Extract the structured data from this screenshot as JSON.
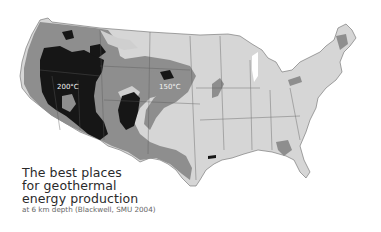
{
  "map": {
    "region": "Contiguous United States",
    "style": "grayscale geothermal temperature map",
    "colors": {
      "background": "#ffffff",
      "land_low": "#d6d6d6",
      "zone_medium": "#8e8e8e",
      "zone_high": "#1a1a1a",
      "state_borders": "#555555"
    },
    "labels": [
      {
        "text": "200°C",
        "x": 57,
        "y": 89
      },
      {
        "text": "150°C",
        "x": 159,
        "y": 89
      }
    ]
  },
  "caption": {
    "line1": "The best places",
    "line2": "for geothermal",
    "line3": "energy production",
    "subtitle": "at 6 km depth (Blackwell, SMU 2004)"
  }
}
